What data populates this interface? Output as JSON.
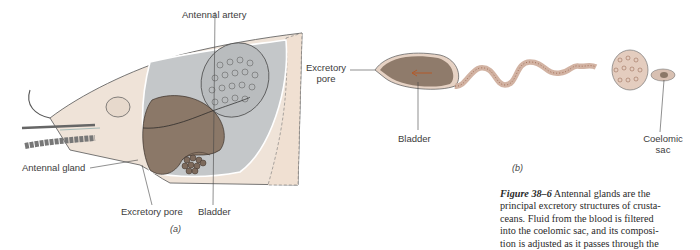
{
  "panel_a": {
    "letter": "(a)",
    "labels": {
      "antennal_artery": "Antennal artery",
      "antennal_gland": "Antennal gland",
      "excretory_pore": "Excretory pore",
      "bladder": "Bladder"
    }
  },
  "panel_b": {
    "letter": "(b)",
    "labels": {
      "excretory_pore_line1": "Excretory",
      "excretory_pore_line2": "pore",
      "bladder": "Bladder",
      "coelomic_sac_line1": "Coelomic",
      "coelomic_sac_line2": "sac"
    }
  },
  "caption": {
    "figure_number": "Figure 38–6",
    "lines": [
      " Antennal glands are the",
      "principal excretory structures of crusta-",
      "ceans. Fluid from the blood is filtered",
      "into the coelomic sac, and its composi-",
      "tion is adjusted as it passes through the"
    ]
  },
  "colors": {
    "shell": "#efe3d8",
    "cavity": "#c4c7c9",
    "organ_brown": "#8b7868",
    "outline": "#3a3a3a",
    "tubule": "#d8b8a8"
  }
}
